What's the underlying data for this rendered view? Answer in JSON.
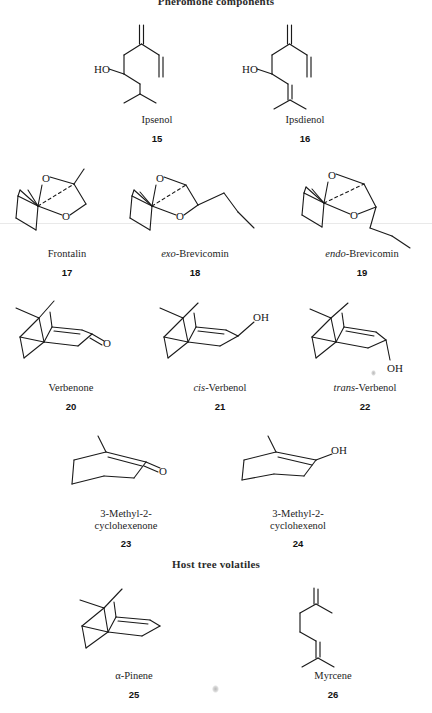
{
  "figure": {
    "sections": [
      {
        "id": "pheromone",
        "title": "Pheromone components"
      },
      {
        "id": "host",
        "title": "Host tree volatiles"
      }
    ],
    "line_color": "#1a1a1a",
    "background": "#ffffff"
  },
  "compounds": [
    {
      "number": "15",
      "name": "Ipsenol",
      "name_italic_prefix": "",
      "name_rest": "Ipsenol",
      "section": "pheromone",
      "atom_labels": [
        "HO"
      ]
    },
    {
      "number": "16",
      "name": "Ipsdienol",
      "name_italic_prefix": "",
      "name_rest": "Ipsdienol",
      "section": "pheromone",
      "atom_labels": [
        "HO"
      ]
    },
    {
      "number": "17",
      "name": "Frontalin",
      "name_italic_prefix": "",
      "name_rest": "Frontalin",
      "section": "pheromone",
      "atom_labels": [
        "O",
        "O"
      ]
    },
    {
      "number": "18",
      "name": "exo-Brevicomin",
      "name_italic_prefix": "exo",
      "name_rest": "-Brevicomin",
      "section": "pheromone",
      "atom_labels": [
        "O",
        "O"
      ]
    },
    {
      "number": "19",
      "name": "endo-Brevicomin",
      "name_italic_prefix": "endo",
      "name_rest": "-Brevicomin",
      "section": "pheromone",
      "atom_labels": [
        "O",
        "O"
      ]
    },
    {
      "number": "20",
      "name": "Verbenone",
      "name_italic_prefix": "",
      "name_rest": "Verbenone",
      "section": "pheromone",
      "atom_labels": [
        "O"
      ]
    },
    {
      "number": "21",
      "name": "cis-Verbenol",
      "name_italic_prefix": "cis",
      "name_rest": "-Verbenol",
      "section": "pheromone",
      "atom_labels": [
        "OH"
      ]
    },
    {
      "number": "22",
      "name": "trans-Verbenol",
      "name_italic_prefix": "trans",
      "name_rest": "-Verbenol",
      "section": "pheromone",
      "atom_labels": [
        "OH"
      ]
    },
    {
      "number": "23",
      "name": "3-Methyl-2-cyclohexenone",
      "name_line1": "3-Methyl-2-",
      "name_line2": "cyclohexenone",
      "section": "pheromone",
      "atom_labels": [
        "O"
      ]
    },
    {
      "number": "24",
      "name": "3-Methyl-2-cyclohexenol",
      "name_line1": "3-Methyl-2-",
      "name_line2": "cyclohexenol",
      "section": "pheromone",
      "atom_labels": [
        "OH"
      ]
    },
    {
      "number": "25",
      "name": "α-Pinene",
      "name_italic_prefix": "",
      "name_rest": "α-Pinene",
      "section": "host",
      "atom_labels": []
    },
    {
      "number": "26",
      "name": "Myrcene",
      "name_italic_prefix": "",
      "name_rest": "Myrcene",
      "section": "host",
      "atom_labels": []
    }
  ],
  "atom_text": {
    "HO": "HO",
    "OH": "OH",
    "O": "O"
  }
}
